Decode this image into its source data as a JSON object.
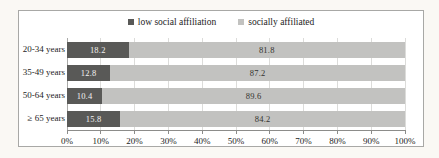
{
  "chart_data": {
    "type": "bar",
    "orientation": "horizontal",
    "stacked": true,
    "categories": [
      "20-34 years",
      "35-49 years",
      "50-64 years",
      "≥ 65 years"
    ],
    "series": [
      {
        "name": "low social affiliation",
        "color": "#595957",
        "label_color": "#f2f2f0",
        "values": [
          18.2,
          12.8,
          10.4,
          15.8
        ]
      },
      {
        "name": "socially affiliated",
        "color": "#c2c2c0",
        "label_color": "#33332f",
        "values": [
          81.8,
          87.2,
          89.6,
          84.2
        ]
      }
    ],
    "x_ticks": [
      "0%",
      "10%",
      "20%",
      "30%",
      "40%",
      "50%",
      "60%",
      "70%",
      "80%",
      "90%",
      "100%"
    ],
    "xlim": [
      0,
      100
    ],
    "grid": true,
    "legend_position": "top",
    "grid_color": "#dcdcda",
    "axis_color": "#8c8c8a"
  }
}
